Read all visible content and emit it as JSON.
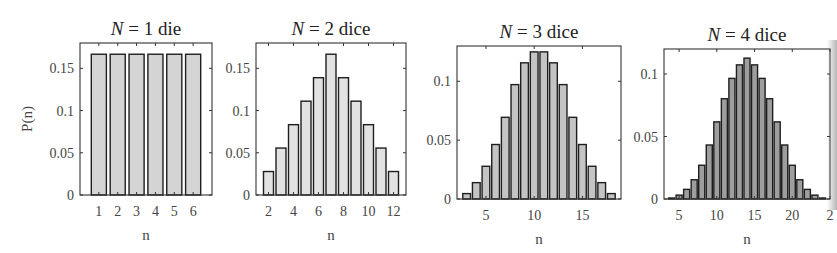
{
  "chart_data": [
    {
      "type": "bar",
      "title": "N = 1 die",
      "title_parts": {
        "var": "N",
        "rest": " = 1 die"
      },
      "xlabel": "n",
      "ylabel": "P(n)",
      "x": [
        1,
        2,
        3,
        4,
        5,
        6
      ],
      "values": [
        0.1667,
        0.1667,
        0.1667,
        0.1667,
        0.1667,
        0.1667
      ],
      "xlim": [
        0,
        7
      ],
      "ylim": [
        0,
        0.18
      ],
      "xticks": [
        1,
        2,
        3,
        4,
        5,
        6
      ],
      "yticks": [
        0,
        0.05,
        0.1,
        0.15
      ],
      "ytick_labels": [
        "0",
        "0.05",
        "0.1",
        "0.15"
      ],
      "bar_color": "#d4d4d4",
      "grid": false
    },
    {
      "type": "bar",
      "title": "N = 2 dice",
      "title_parts": {
        "var": "N",
        "rest": " = 2 dice"
      },
      "xlabel": "n",
      "ylabel": "",
      "x": [
        2,
        3,
        4,
        5,
        6,
        7,
        8,
        9,
        10,
        11,
        12
      ],
      "values": [
        0.0278,
        0.0556,
        0.0833,
        0.1111,
        0.1389,
        0.1667,
        0.1389,
        0.1111,
        0.0833,
        0.0556,
        0.0278
      ],
      "xlim": [
        1,
        13
      ],
      "ylim": [
        0,
        0.18
      ],
      "xticks": [
        2,
        4,
        6,
        8,
        10,
        12
      ],
      "yticks": [
        0,
        0.05,
        0.1,
        0.15
      ],
      "ytick_labels": [
        "0",
        "0.05",
        "0.1",
        "0.15"
      ],
      "bar_color": "#e2e2e2",
      "grid": false
    },
    {
      "type": "bar",
      "title": "N = 3 dice",
      "title_parts": {
        "var": "N",
        "rest": " = 3 dice"
      },
      "xlabel": "n",
      "ylabel": "",
      "x": [
        3,
        4,
        5,
        6,
        7,
        8,
        9,
        10,
        11,
        12,
        13,
        14,
        15,
        16,
        17,
        18
      ],
      "values": [
        0.0046,
        0.0139,
        0.0278,
        0.0463,
        0.0694,
        0.0972,
        0.1157,
        0.125,
        0.125,
        0.1157,
        0.0972,
        0.0694,
        0.0463,
        0.0278,
        0.0139,
        0.0046
      ],
      "xlim": [
        2,
        19
      ],
      "ylim": [
        0,
        0.13
      ],
      "xticks": [
        5,
        10,
        15
      ],
      "yticks": [
        0,
        0.05,
        0.1
      ],
      "ytick_labels": [
        "0",
        "0.05",
        "0.1"
      ],
      "bar_color": "#c4c4c4",
      "grid": false
    },
    {
      "type": "bar",
      "title": "N = 4 dice",
      "title_parts": {
        "var": "N",
        "rest": " = 4 dice"
      },
      "xlabel": "n",
      "ylabel": "",
      "x": [
        4,
        5,
        6,
        7,
        8,
        9,
        10,
        11,
        12,
        13,
        14,
        15,
        16,
        17,
        18,
        19,
        20,
        21,
        22,
        23,
        24
      ],
      "values": [
        0.0008,
        0.0031,
        0.0077,
        0.0154,
        0.027,
        0.0432,
        0.0617,
        0.0802,
        0.0965,
        0.1073,
        0.1127,
        0.1073,
        0.0965,
        0.0802,
        0.0617,
        0.0432,
        0.027,
        0.0154,
        0.0077,
        0.0031,
        0.0008
      ],
      "xlim": [
        3,
        25
      ],
      "ylim": [
        0,
        0.12
      ],
      "xticks": [
        5,
        10,
        15,
        20,
        25
      ],
      "xtick_labels": [
        "5",
        "10",
        "15",
        "20",
        "2"
      ],
      "yticks": [
        0,
        0.05,
        0.1
      ],
      "ytick_labels": [
        "0",
        "0.05",
        "0.1"
      ],
      "bar_color": "#9e9e9e",
      "grid": false
    }
  ],
  "layout": {
    "panels": [
      {
        "x0": 80,
        "x1": 212,
        "y0": 43,
        "y1": 195
      },
      {
        "x0": 256,
        "x1": 406,
        "y0": 43,
        "y1": 195
      },
      {
        "x0": 457,
        "x1": 621,
        "y0": 46,
        "y1": 199
      },
      {
        "x0": 664,
        "x1": 830,
        "y0": 49,
        "y1": 199
      }
    ]
  }
}
